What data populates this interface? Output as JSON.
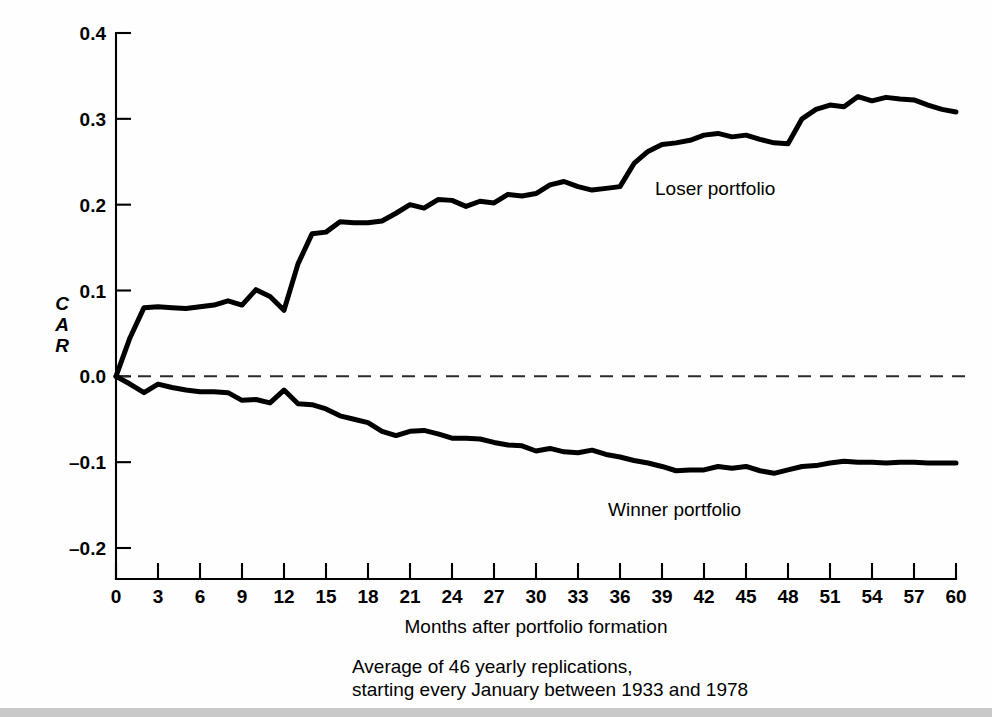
{
  "chart_data": {
    "type": "line",
    "title": "",
    "xlabel": "Months after portfolio formation",
    "ylabel": "CAR",
    "ylabel_stacked": [
      "C",
      "A",
      "R"
    ],
    "xlim": [
      0,
      60
    ],
    "ylim": [
      -0.2,
      0.4
    ],
    "x_ticks": [
      0,
      3,
      6,
      9,
      12,
      15,
      18,
      21,
      24,
      27,
      30,
      33,
      36,
      39,
      42,
      45,
      48,
      51,
      54,
      57,
      60
    ],
    "x_tick_labels": [
      "0",
      "3",
      "6",
      "9",
      "12",
      "15",
      "18",
      "21",
      "24",
      "27",
      "30",
      "33",
      "36",
      "39",
      "42",
      "45",
      "48",
      "51",
      "54",
      "57",
      "60"
    ],
    "x_minor_step": 1,
    "y_ticks": [
      -0.2,
      -0.1,
      0.0,
      0.1,
      0.2,
      0.3,
      0.4
    ],
    "y_tick_labels": [
      "–0.2",
      "–0.1",
      "0.0",
      "0.1",
      "0.2",
      "0.3",
      "0.4"
    ],
    "grid": false,
    "legend_position": "inline-annotations",
    "zero_reference_line": {
      "value": 0.0,
      "style": "dashed",
      "color": "#2b2b2b"
    },
    "caption_lines": [
      "Average of 46 yearly replications,",
      "starting every January between 1933 and 1978"
    ],
    "annotations": [
      {
        "text": "Loser portfolio",
        "x": 38.5,
        "y": 0.228,
        "series": "Loser portfolio"
      },
      {
        "text": "Winner portfolio",
        "x": 39.0,
        "y": -0.143,
        "series": "Winner portfolio"
      }
    ],
    "x": [
      0,
      1,
      2,
      3,
      4,
      5,
      6,
      7,
      8,
      9,
      10,
      11,
      12,
      13,
      14,
      15,
      16,
      17,
      18,
      19,
      20,
      21,
      22,
      23,
      24,
      25,
      26,
      27,
      28,
      29,
      30,
      31,
      32,
      33,
      34,
      35,
      36,
      37,
      38,
      39,
      40,
      41,
      42,
      43,
      44,
      45,
      46,
      47,
      48,
      49,
      50,
      51,
      52,
      53,
      54,
      55,
      56,
      57,
      58,
      59,
      60
    ],
    "series": [
      {
        "name": "Loser portfolio",
        "color": "#000000",
        "values": [
          0.0,
          0.045,
          0.08,
          0.081,
          0.08,
          0.079,
          0.081,
          0.083,
          0.088,
          0.083,
          0.101,
          0.093,
          0.077,
          0.131,
          0.166,
          0.168,
          0.18,
          0.179,
          0.179,
          0.181,
          0.19,
          0.2,
          0.196,
          0.206,
          0.205,
          0.198,
          0.204,
          0.202,
          0.212,
          0.21,
          0.213,
          0.223,
          0.227,
          0.221,
          0.217,
          0.219,
          0.221,
          0.248,
          0.262,
          0.27,
          0.272,
          0.275,
          0.281,
          0.283,
          0.279,
          0.281,
          0.276,
          0.272,
          0.271,
          0.3,
          0.311,
          0.316,
          0.314,
          0.326,
          0.321,
          0.325,
          0.323,
          0.322,
          0.316,
          0.311,
          0.308
        ]
      },
      {
        "name": "Winner portfolio",
        "color": "#000000",
        "values": [
          0.0,
          -0.009,
          -0.019,
          -0.009,
          -0.013,
          -0.016,
          -0.018,
          -0.018,
          -0.019,
          -0.028,
          -0.027,
          -0.031,
          -0.016,
          -0.032,
          -0.033,
          -0.038,
          -0.046,
          -0.05,
          -0.054,
          -0.064,
          -0.069,
          -0.064,
          -0.063,
          -0.067,
          -0.072,
          -0.072,
          -0.073,
          -0.077,
          -0.08,
          -0.081,
          -0.087,
          -0.084,
          -0.088,
          -0.089,
          -0.086,
          -0.091,
          -0.094,
          -0.098,
          -0.101,
          -0.105,
          -0.11,
          -0.109,
          -0.109,
          -0.105,
          -0.107,
          -0.105,
          -0.11,
          -0.113,
          -0.109,
          -0.105,
          -0.104,
          -0.101,
          -0.099,
          -0.1,
          -0.1,
          -0.101,
          -0.1,
          -0.1,
          -0.101,
          -0.101,
          -0.101
        ]
      }
    ]
  }
}
